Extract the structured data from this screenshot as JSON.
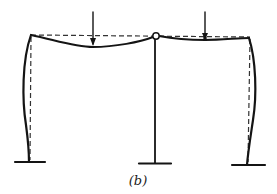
{
  "figure": {
    "caption": "(b)",
    "colors": {
      "line": "#141414",
      "dashed": "#333333",
      "background": "#ffffff"
    },
    "elements": {
      "loads": [
        {
          "name": "left-load-arrow",
          "x": 93
        },
        {
          "name": "right-load-arrow",
          "x": 205
        }
      ],
      "hinge": {
        "name": "center-hinge",
        "x": 156,
        "y": 36
      },
      "columns": [
        "left-column",
        "center-column",
        "right-column"
      ],
      "supports": [
        "left-fixed-support",
        "center-fixed-support",
        "right-fixed-support"
      ]
    }
  }
}
